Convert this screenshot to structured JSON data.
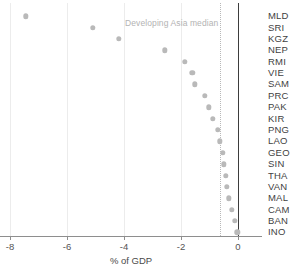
{
  "chart_data": {
    "type": "scatter",
    "title": "",
    "xlabel": "% of GDP",
    "ylabel": "",
    "xlim": [
      -8.6,
      0.8
    ],
    "xticks": [
      -8,
      -6,
      -4,
      -2,
      0
    ],
    "xtick_labels": [
      "-8",
      "-6",
      "-4",
      "-2",
      "0"
    ],
    "grid": "vertical-at-xticks",
    "legend": "none",
    "categories": [
      "MLD",
      "SRI",
      "KGZ",
      "NEP",
      "RMI",
      "VIE",
      "SAM",
      "PRC",
      "PAK",
      "KIR",
      "PNG",
      "LAO",
      "GEO",
      "SIN",
      "THA",
      "VAN",
      "MAL",
      "CAM",
      "BAN",
      "INO"
    ],
    "values": [
      -7.44,
      -5.09,
      -4.18,
      -2.56,
      -1.86,
      -1.61,
      -1.51,
      -1.16,
      -1.02,
      -0.88,
      -0.7,
      -0.63,
      -0.53,
      -0.49,
      -0.42,
      -0.39,
      -0.32,
      -0.21,
      -0.11,
      -0.02
    ],
    "annotations": [
      {
        "name": "developing-asia-median",
        "label": "Developing Asia median",
        "value": -0.63,
        "line_style": "dotted"
      },
      {
        "name": "zero-reference-line",
        "label": "",
        "value": 0,
        "line_style": "solid"
      }
    ],
    "colors": {
      "dot": "#b9b9b9",
      "gridline": "#ececec",
      "zero_line": "#3d3d3d",
      "median_line": "#b8b8b8",
      "median_label": "#b3b3b3",
      "axis": "#8e8e8e",
      "text": "#3f3f3f"
    }
  }
}
